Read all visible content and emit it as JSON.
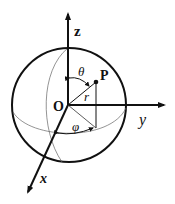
{
  "diagram": {
    "labels": {
      "z_axis": "z",
      "y_axis": "y",
      "x_axis": "x",
      "origin": "O",
      "point": "P",
      "radius": "r",
      "polar_angle": "θ",
      "azimuth_angle": "φ"
    },
    "colors": {
      "stroke": "#111111",
      "thin_stroke": "#555555",
      "background": "#ffffff"
    }
  }
}
